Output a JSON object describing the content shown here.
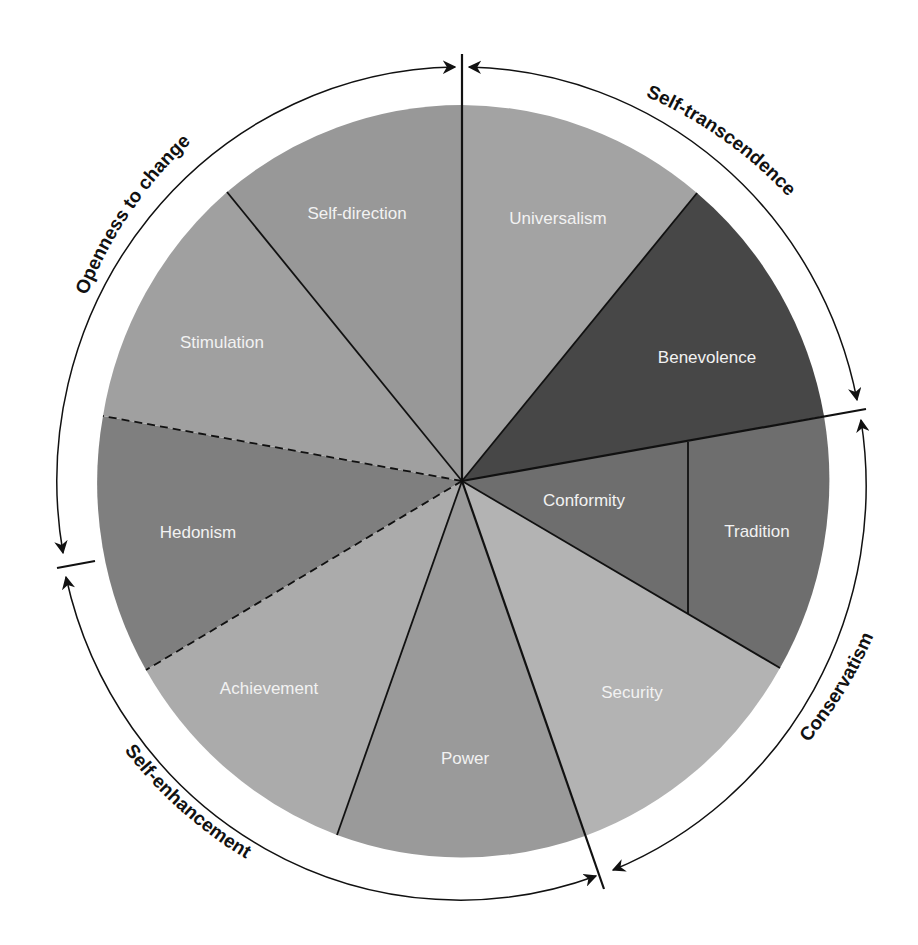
{
  "diagram": {
    "type": "circular-values-model",
    "center": [
      462,
      481
    ],
    "pie_radius": [
      368,
      376
    ],
    "outer_arc_radius": [
      404,
      414
    ],
    "slices": [
      {
        "id": "universalism",
        "label": "Universalism",
        "start_deg": 0,
        "end_deg": 39.2,
        "color": "#a3a3a3",
        "label_pos": [
          558,
          218
        ]
      },
      {
        "id": "benevolence",
        "label": "Benevolence",
        "start_deg": 39.2,
        "end_deg": 79.9,
        "color": "#4a4a4a",
        "label_pos": [
          707,
          362
        ]
      },
      {
        "id": "conformity",
        "label": "Conformity",
        "start_deg": 79.9,
        "end_deg": 120.5,
        "color": "#6f6f6f",
        "label_pos": [
          584,
          505
        ]
      },
      {
        "id": "tradition",
        "label": "Tradition",
        "start_deg": 79.9,
        "end_deg": 120.5,
        "color": "#6f6f6f",
        "label_pos": [
          757,
          536
        ]
      },
      {
        "id": "security",
        "label": "Security",
        "start_deg": 120.5,
        "end_deg": 160.8,
        "color": "#b4b4b4",
        "label_pos": [
          632,
          697
        ]
      },
      {
        "id": "power",
        "label": "Power",
        "start_deg": 160.8,
        "end_deg": 199.4,
        "color": "#9a9a9a",
        "label_pos": [
          465,
          763
        ]
      },
      {
        "id": "achievement",
        "label": "Achievement",
        "start_deg": 199.4,
        "end_deg": 239.1,
        "color": "#ababab",
        "label_pos": [
          269,
          693
        ]
      },
      {
        "id": "hedonism",
        "label": "Hedonism",
        "start_deg": 239.1,
        "end_deg": 280.3,
        "color": "#808080",
        "label_pos": [
          198,
          537
        ]
      },
      {
        "id": "stimulation",
        "label": "Stimulation",
        "start_deg": 280.3,
        "end_deg": 320.9,
        "color": "#a0a0a0",
        "label_pos": [
          222,
          347
        ]
      },
      {
        "id": "self-direction",
        "label": "Self-direction",
        "start_deg": 320.9,
        "end_deg": 360,
        "color": "#999999",
        "label_pos": [
          357,
          218
        ]
      }
    ],
    "higher_order_groups": [
      {
        "id": "self-transcendence",
        "label": "Self-transcendence"
      },
      {
        "id": "conservatism",
        "label": "Conservatism"
      },
      {
        "id": "self-enhancement",
        "label": "Self-enhancement"
      },
      {
        "id": "openness-to-change",
        "label": "Openness to change"
      }
    ],
    "dashed_boundaries": [
      "achievement|hedonism",
      "hedonism|stimulation"
    ],
    "line_color": "#111111"
  }
}
